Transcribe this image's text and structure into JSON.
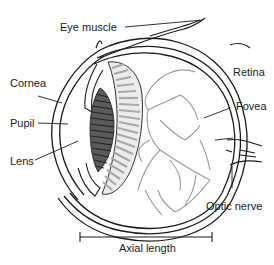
{
  "diagram": {
    "labels": {
      "eye_muscle": "Eye muscle",
      "cornea": "Cornea",
      "pupil": "Pupil",
      "lens": "Lens",
      "retina": "Retina",
      "fovea": "Fovea",
      "optic_nerve": "Optic nerve",
      "axial_length": "Axial length"
    },
    "colors": {
      "outline": "#1a1a1a",
      "vessels": "#9a9a9a",
      "ciliary_light": "#a8a8a8",
      "lens_dark": "#3a3a3a",
      "background": "#ffffff"
    }
  }
}
